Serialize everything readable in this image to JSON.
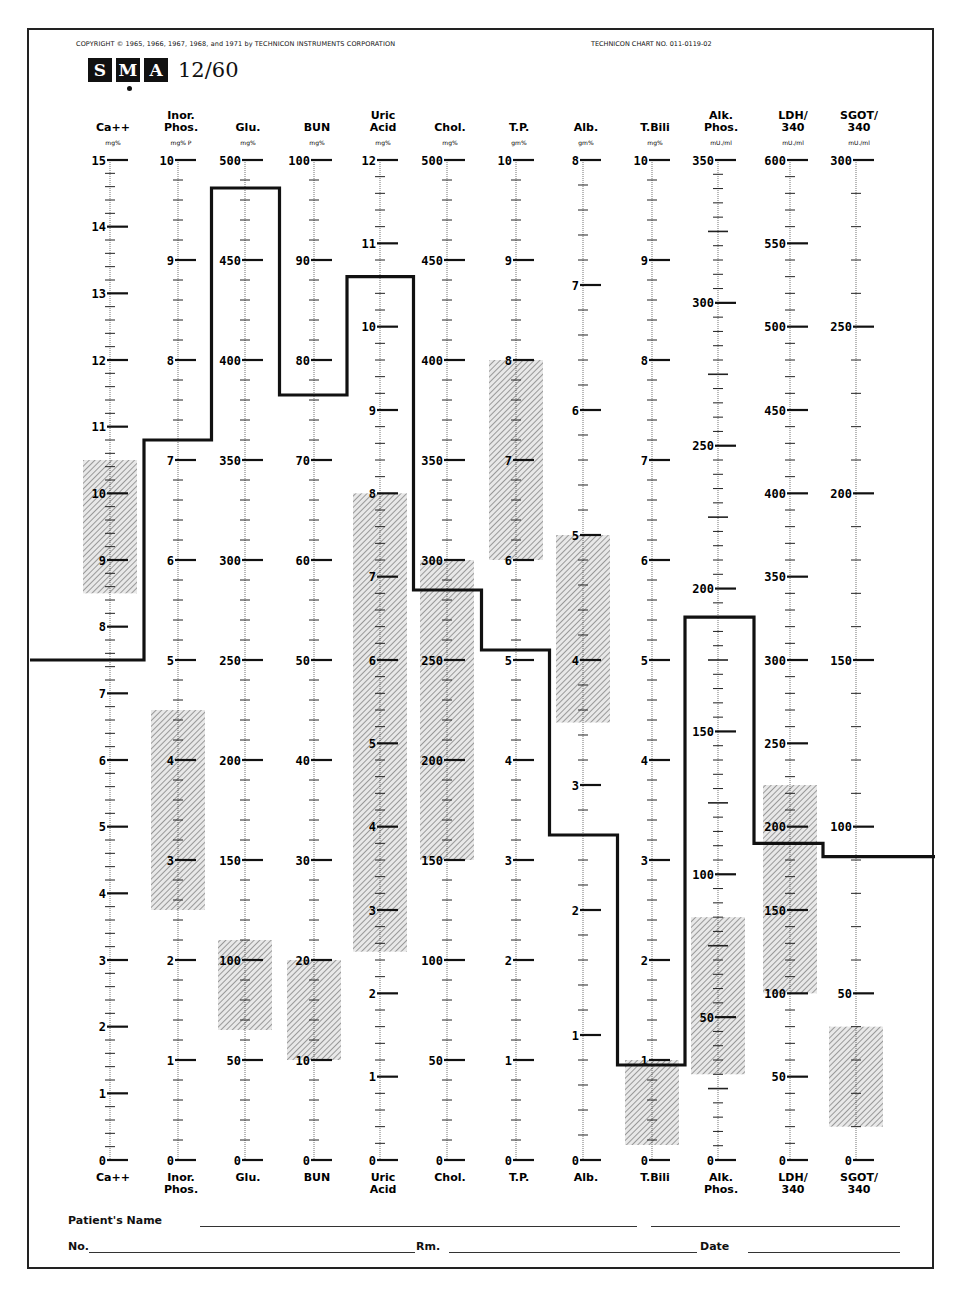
{
  "header": {
    "copyright": "COPYRIGHT © 1965, 1966, 1967, 1968, and 1971 by TECHNICON INSTRUMENTS CORPORATION",
    "chart_number": "TECHNICON CHART NO. 011-0119-02",
    "logo_letters": [
      "S",
      "M",
      "A"
    ],
    "model": "12/60"
  },
  "footer": {
    "patient_name_label": "Patient's Name",
    "no_label": "No.",
    "rm_label": "Rm.",
    "date_label": "Date"
  },
  "chart_data": {
    "type": "line",
    "subtitle": "TECHNICON CHART NO. 011-0119-02",
    "xlabel": "",
    "ylabel": "",
    "grid": false,
    "legend": "none",
    "categories": [
      "Ca++",
      "Inor. Phos.",
      "Glu.",
      "BUN",
      "Uric Acid",
      "Chol.",
      "T.P.",
      "Alb.",
      "T.Bili",
      "Alk. Phos.",
      "LDH/340",
      "SGOT/340"
    ],
    "scales": [
      {
        "name": "Ca++",
        "top_lines": [
          "",
          "Ca++"
        ],
        "bottom_lines": [
          "Ca++"
        ],
        "unit": "mg%",
        "min": 0,
        "max": 15,
        "labels": [
          0,
          1,
          2,
          3,
          4,
          5,
          6,
          7,
          8,
          9,
          10,
          11,
          12,
          13,
          14,
          15
        ],
        "minor_step": 0.2,
        "normal_range": [
          8.5,
          10.5
        ],
        "value": 7.5
      },
      {
        "name": "Inor. Phos.",
        "top_lines": [
          "Inor.",
          "Phos."
        ],
        "bottom_lines": [
          "Inor.",
          "Phos."
        ],
        "unit": "mg% P",
        "min": 0,
        "max": 10,
        "labels": [
          0,
          1,
          2,
          3,
          4,
          5,
          6,
          7,
          8,
          9,
          10
        ],
        "minor_step": 0.2,
        "normal_range": [
          2.5,
          4.5
        ],
        "value": 7.2
      },
      {
        "name": "Glu.",
        "top_lines": [
          "",
          "Glu."
        ],
        "bottom_lines": [
          "Glu."
        ],
        "unit": "mg%",
        "min": 0,
        "max": 500,
        "labels": [
          0,
          50,
          100,
          150,
          200,
          250,
          300,
          350,
          400,
          450,
          500
        ],
        "minor_step": 10,
        "normal_range": [
          65,
          110
        ],
        "value": 486
      },
      {
        "name": "BUN",
        "top_lines": [
          "",
          "BUN"
        ],
        "bottom_lines": [
          "BUN"
        ],
        "unit": "mg%",
        "min": 0,
        "max": 100,
        "labels": [
          0,
          10,
          20,
          30,
          40,
          50,
          60,
          70,
          80,
          90,
          100
        ],
        "minor_step": 2,
        "normal_range": [
          10,
          20
        ],
        "value": 76.5
      },
      {
        "name": "Uric Acid",
        "top_lines": [
          "Uric",
          "Acid"
        ],
        "bottom_lines": [
          "Uric",
          "Acid"
        ],
        "unit": "mg%",
        "min": 0,
        "max": 12,
        "labels": [
          0,
          1,
          2,
          3,
          4,
          5,
          6,
          7,
          8,
          9,
          10,
          11,
          12
        ],
        "minor_step": 0.2,
        "normal_range": [
          2.5,
          8
        ],
        "value": 10.6
      },
      {
        "name": "Chol.",
        "top_lines": [
          "",
          "Chol."
        ],
        "bottom_lines": [
          "Chol."
        ],
        "unit": "mg%",
        "min": 0,
        "max": 500,
        "labels": [
          0,
          50,
          100,
          150,
          200,
          250,
          300,
          350,
          400,
          450,
          500
        ],
        "minor_step": 10,
        "normal_range": [
          150,
          300
        ],
        "value": 285
      },
      {
        "name": "T.P.",
        "top_lines": [
          "",
          "T.P."
        ],
        "bottom_lines": [
          "T.P."
        ],
        "unit": "gm%",
        "min": 0,
        "max": 10,
        "labels": [
          0,
          1,
          2,
          3,
          4,
          5,
          6,
          7,
          8,
          9,
          10
        ],
        "minor_step": 0.2,
        "normal_range": [
          6,
          8
        ],
        "value": 5.1
      },
      {
        "name": "Alb.",
        "top_lines": [
          "",
          "Alb."
        ],
        "bottom_lines": [
          "Alb."
        ],
        "unit": "gm%",
        "min": 0,
        "max": 8,
        "labels": [
          0,
          1,
          2,
          3,
          4,
          5,
          6,
          7,
          8
        ],
        "minor_step": 0.2,
        "normal_range": [
          3.5,
          5
        ],
        "value": 2.6
      },
      {
        "name": "T.Bili",
        "top_lines": [
          "",
          "T.Bili"
        ],
        "bottom_lines": [
          "T.Bili"
        ],
        "unit": "mg%",
        "min": 0,
        "max": 10,
        "labels": [
          0,
          1,
          2,
          3,
          4,
          5,
          6,
          7,
          8,
          9,
          10
        ],
        "minor_step": 0.2,
        "normal_range": [
          0.15,
          1.0
        ],
        "value": 0.95
      },
      {
        "name": "Alk. Phos.",
        "top_lines": [
          "Alk.",
          "Phos."
        ],
        "bottom_lines": [
          "Alk.",
          "Phos."
        ],
        "unit": "mU./ml",
        "min": 0,
        "max": 350,
        "labels": [
          0,
          50,
          100,
          150,
          200,
          250,
          300,
          350
        ],
        "minor_step": 5,
        "normal_range": [
          30,
          85
        ],
        "value": 190
      },
      {
        "name": "LDH/340",
        "top_lines": [
          "LDH/",
          "340"
        ],
        "bottom_lines": [
          "LDH/",
          "340"
        ],
        "unit": "mU./ml",
        "min": 0,
        "max": 600,
        "labels": [
          0,
          50,
          100,
          150,
          200,
          250,
          300,
          350,
          400,
          450,
          500,
          550,
          600
        ],
        "minor_step": 10,
        "normal_range": [
          100,
          225
        ],
        "value": 190
      },
      {
        "name": "SGOT/340",
        "top_lines": [
          "SGOT/",
          "340"
        ],
        "bottom_lines": [
          "SGOT/",
          "340"
        ],
        "unit": "mU./ml",
        "min": 0,
        "max": 300,
        "labels": [
          0,
          50,
          100,
          150,
          200,
          250,
          300
        ],
        "minor_step": 10,
        "normal_range": [
          10,
          40
        ],
        "value": 91
      }
    ],
    "series": [
      {
        "name": "Patient profile",
        "values": [
          7.5,
          7.2,
          486,
          76.5,
          10.6,
          285,
          5.1,
          2.6,
          0.95,
          190,
          190,
          91
        ]
      }
    ],
    "layout": {
      "axis_x": [
        110,
        178,
        245,
        314,
        380,
        447,
        516,
        583,
        652,
        718,
        790,
        856
      ],
      "y_top": 160,
      "y_bottom": 1160,
      "line_start_x": 30,
      "line_end_x": 935
    }
  }
}
